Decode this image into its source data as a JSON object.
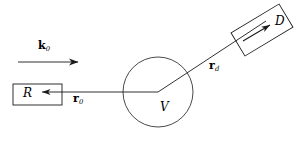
{
  "figure": {
    "name": "scattering-geometry-diagram",
    "width": 303,
    "height": 141,
    "background_color": "#ffffff",
    "stroke_color": "#1a1a1a"
  },
  "labels": {
    "incident_wavevector": {
      "symbol": "k",
      "subscript": "0",
      "bold": true
    },
    "source": {
      "symbol": "R"
    },
    "source_position_vector": {
      "symbol": "r",
      "subscript": "0",
      "bold": true
    },
    "scattering_volume": {
      "symbol": "V"
    },
    "detector_position_vector": {
      "symbol": "r",
      "subscript": "d",
      "bold": true
    },
    "detector": {
      "symbol": "D"
    }
  },
  "geometry": {
    "source_box": {
      "x": 13,
      "y": 84,
      "width": 49,
      "height": 21
    },
    "detector_box": {
      "center_x": 262,
      "center_y": 30,
      "width": 56,
      "height": 27,
      "rotation_deg": -31
    },
    "scattering_volume_circle": {
      "cx": 158,
      "cy": 92,
      "r": 35
    },
    "incident_beam_arrow": {
      "x1": 18,
      "y1": 62,
      "x2": 80,
      "y2": 62
    },
    "r0_arrow": {
      "x1": 158,
      "y1": 92,
      "x2": 66,
      "y2": 92
    },
    "rd_line": {
      "x1": 158,
      "y1": 92,
      "x2": 265,
      "y2": 22
    },
    "detector_inner_arrow": {
      "x1": 243,
      "y1": 41,
      "x2": 272,
      "y2": 24
    }
  }
}
